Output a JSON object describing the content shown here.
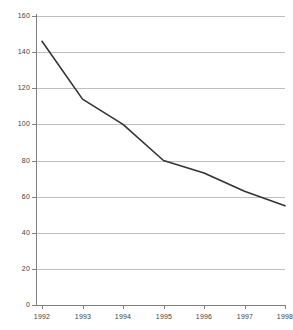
{
  "chart_data": {
    "type": "line",
    "title": "",
    "subtitle": "",
    "xlabel": "",
    "ylabel": "",
    "categories": [
      "1992",
      "1993",
      "1994",
      "1995",
      "1996",
      "1997",
      "1998"
    ],
    "x": [
      1992,
      1993,
      1994,
      1995,
      1996,
      1997,
      1998
    ],
    "series": [
      {
        "name": "series-1",
        "values": [
          146,
          114,
          100,
          80,
          73,
          63,
          55
        ],
        "color": "#333333",
        "line_width": 1.6,
        "markers": false
      }
    ],
    "values": [
      146,
      114,
      100,
      80,
      73,
      63,
      55
    ],
    "ylim": [
      0,
      160
    ],
    "ytick_step": 20,
    "ytick_labels": [
      "0",
      "20",
      "40",
      "60",
      "80",
      "100",
      "120",
      "140",
      "160"
    ],
    "ytick_values": [
      0,
      20,
      40,
      60,
      80,
      100,
      120,
      140,
      160
    ],
    "xtick_labels": [
      "1992",
      "1993",
      "1994",
      "1995",
      "1996",
      "1997",
      "1998"
    ],
    "xlim": [
      1992,
      1998
    ],
    "grid": {
      "horizontal": true,
      "vertical": false,
      "color": "#bfbfbf"
    },
    "legend": {
      "visible": false,
      "position": "none",
      "entries": []
    },
    "axis_color": "#808080",
    "background_color": "#ffffff",
    "tick_label_color": "#404040",
    "annotations": []
  }
}
